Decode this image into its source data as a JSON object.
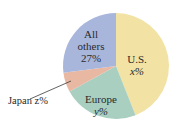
{
  "chart_data": {
    "type": "pie",
    "title": "",
    "start_angle_deg": 0,
    "direction": "clockwise",
    "slices": [
      {
        "label": "U.S.",
        "value_label": "x%",
        "value": 44,
        "color": "#f2e2a4"
      },
      {
        "label": "Europe",
        "value_label": "y%",
        "value": 23,
        "color": "#a9cfc1"
      },
      {
        "label": "Japan",
        "value_label": "z%",
        "value": 6,
        "color": "#e8b8a2"
      },
      {
        "label": "All others",
        "value_label": "27%",
        "value": 27,
        "color": "#a9b6dc"
      }
    ]
  },
  "labels": {
    "us_name": "U.S.",
    "us_value": "x%",
    "europe_name": "Europe",
    "europe_value": "y%",
    "japan": "Japan z%",
    "others_line1": "All",
    "others_line2": "others",
    "others_value": "27%"
  }
}
